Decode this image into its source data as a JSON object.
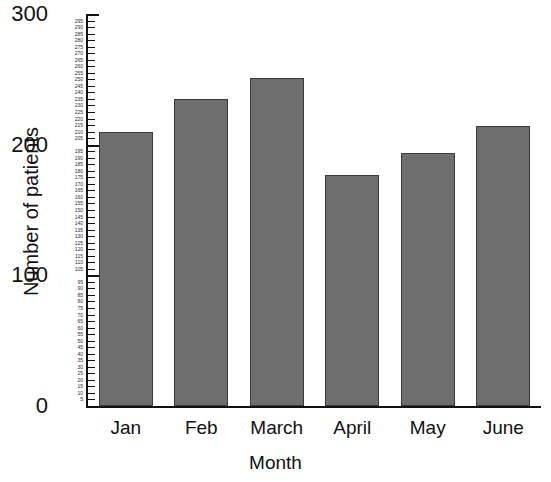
{
  "chart_data": {
    "type": "bar",
    "title": "",
    "xlabel": "Month",
    "ylabel": "Number of patients",
    "categories": [
      "Jan",
      "Feb",
      "March",
      "April",
      "May",
      "June"
    ],
    "values": [
      210,
      235,
      251,
      177,
      194,
      214
    ],
    "ylim": [
      0,
      300
    ],
    "xlim_note": "categorical",
    "grid": false,
    "legend": "none",
    "y_major_ticks": [
      0,
      100,
      200,
      300
    ],
    "y_minor_tick_step": 5,
    "y_minor_ticks": [
      5,
      10,
      15,
      20,
      25,
      30,
      35,
      40,
      45,
      50,
      55,
      60,
      65,
      70,
      75,
      80,
      85,
      90,
      95,
      105,
      110,
      115,
      120,
      125,
      130,
      135,
      140,
      145,
      150,
      155,
      160,
      165,
      170,
      175,
      180,
      185,
      190,
      195,
      205,
      210,
      215,
      220,
      225,
      230,
      235,
      240,
      245,
      250,
      255,
      260,
      265,
      270,
      275,
      280,
      285,
      290,
      295
    ],
    "series": [
      {
        "name": "Number of patients",
        "values": [
          210,
          235,
          251,
          177,
          194,
          214
        ]
      }
    ],
    "bar_color": "#6e6e6e",
    "bar_edge_color": "#3b3b3b",
    "axis_color": "#111111",
    "background_color": "#ffffff"
  }
}
